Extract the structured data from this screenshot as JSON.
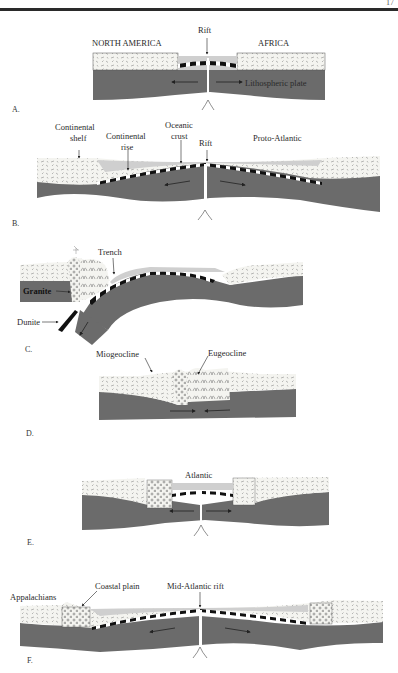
{
  "page": {
    "page_number": "17"
  },
  "colors": {
    "lithosphere": "#6b6b6b",
    "continental_crust": "#f4f4f0",
    "ocean_water": "#cfcfcf",
    "oceanic_crust_dark": "#111111",
    "rift": "#ffffff",
    "rule": "#2a2a2a"
  },
  "panels": [
    {
      "id": "A",
      "label": "A.",
      "annotations": [
        "NORTH AMERICA",
        "AFRICA",
        "Rift",
        "Lithospheric plate"
      ]
    },
    {
      "id": "B",
      "label": "B.",
      "annotations": [
        "Continental shelf",
        "Continental rise",
        "Oceanic crust",
        "Rift",
        "Proto-Atlantic"
      ]
    },
    {
      "id": "C",
      "label": "C.",
      "annotations": [
        "Trench",
        "Granite",
        "Dunite"
      ]
    },
    {
      "id": "D",
      "label": "D.",
      "annotations": [
        "Miogeocline",
        "Eugeocline"
      ]
    },
    {
      "id": "E",
      "label": "E.",
      "annotations": [
        "Atlantic"
      ]
    },
    {
      "id": "F",
      "label": "F.",
      "annotations": [
        "Appalachians",
        "Coastal plain",
        "Mid-Atlantic rift"
      ]
    }
  ],
  "labels": {
    "a_north_america": "NORTH AMERICA",
    "a_africa": "AFRICA",
    "a_rift": "Rift",
    "a_plate": "Lithospheric plate",
    "b_shelf_1": "Continental",
    "b_shelf_2": "shelf",
    "b_rise_1": "Continental",
    "b_rise_2": "rise",
    "b_crust_1": "Oceanic",
    "b_crust_2": "crust",
    "b_rift": "Rift",
    "b_proto": "Proto-Atlantic",
    "c_trench": "Trench",
    "c_granite": "Granite",
    "c_dunite": "Dunite",
    "d_mio": "Miogeocline",
    "d_eu": "Eugeocline",
    "e_atlantic": "Atlantic",
    "f_app": "Appalachians",
    "f_coastal": "Coastal plain",
    "f_rift": "Mid-Atlantic rift",
    "panel_a": "A.",
    "panel_b": "B.",
    "panel_c": "C.",
    "panel_d": "D.",
    "panel_e": "E.",
    "panel_f": "F."
  }
}
